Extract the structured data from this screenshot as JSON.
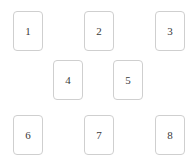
{
  "canvas": {
    "width": 196,
    "height": 166,
    "background_color": "#ffffff"
  },
  "style": {
    "card_border_color": "#cfcfcf",
    "card_background_color": "#ffffff",
    "card_text_color": "#3a3a3a",
    "card_width": 30,
    "card_height": 40,
    "card_corner_radius": 4
  },
  "cards": [
    {
      "id": "card-1",
      "label": "1",
      "x": 13,
      "y": 11,
      "row": 1,
      "column": 1
    },
    {
      "id": "card-2",
      "label": "2",
      "x": 84,
      "y": 11,
      "row": 1,
      "column": 2
    },
    {
      "id": "card-3",
      "label": "3",
      "x": 155,
      "y": 11,
      "row": 1,
      "column": 3
    },
    {
      "id": "card-4",
      "label": "4",
      "x": 53,
      "y": 60,
      "row": 2,
      "column": 1
    },
    {
      "id": "card-5",
      "label": "5",
      "x": 113,
      "y": 60,
      "row": 2,
      "column": 2
    },
    {
      "id": "card-6",
      "label": "6",
      "x": 13,
      "y": 115,
      "row": 3,
      "column": 1
    },
    {
      "id": "card-7",
      "label": "7",
      "x": 84,
      "y": 115,
      "row": 3,
      "column": 2
    },
    {
      "id": "card-8",
      "label": "8",
      "x": 155,
      "y": 115,
      "row": 3,
      "column": 3
    }
  ]
}
